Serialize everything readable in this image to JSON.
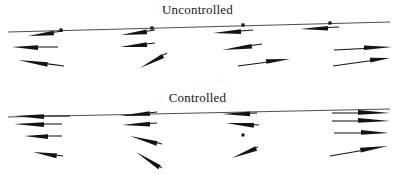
{
  "figure": {
    "caption_top": "Uncontrolled",
    "caption_bottom": "Controlled",
    "ink_color": "#141414",
    "baseline_color": "#3a3a3a",
    "background_color": "#ffffff"
  },
  "panels": [
    {
      "id": "uncontrolled",
      "title": "Uncontrolled"
    },
    {
      "id": "controlled",
      "title": "Controlled"
    }
  ],
  "chart_data": {
    "type": "scatter",
    "subtitle": "",
    "xlabel": "",
    "ylabel": "",
    "grid": false,
    "legend": "none",
    "xlim": [
      0,
      395
    ],
    "ylim": [
      0,
      175
    ],
    "panels": [
      {
        "name": "Uncontrolled",
        "title": "Uncontrolled",
        "baseline": {
          "x1": 8,
          "y1": 32,
          "x2": 390,
          "y2": 22,
          "tilt_deg": -1.5
        },
        "nodes": [
          {
            "x": 61,
            "y": 30
          },
          {
            "x": 152,
            "y": 28
          },
          {
            "x": 243,
            "y": 25
          },
          {
            "x": 330,
            "y": 23
          }
        ],
        "stations": [
          {
            "station": 1,
            "x": 61,
            "vectors": [
              {
                "row": 1,
                "tip_x": 28,
                "tip_y": 36,
                "tail_x": 63,
                "tail_y": 31,
                "length": 35,
                "angle_deg": 188,
                "direction": "left",
                "head_len": 26
              },
              {
                "row": 2,
                "tip_x": 12,
                "tip_y": 47,
                "tail_x": 58,
                "tail_y": 47,
                "length": 46,
                "angle_deg": 180,
                "direction": "left",
                "head_len": 26
              },
              {
                "row": 3,
                "tip_x": 18,
                "tip_y": 60,
                "tail_x": 64,
                "tail_y": 66,
                "length": 46,
                "angle_deg": 187,
                "direction": "left",
                "head_len": 30
              }
            ]
          },
          {
            "station": 2,
            "x": 152,
            "vectors": [
              {
                "row": 1,
                "tip_x": 121,
                "tip_y": 35,
                "tail_x": 155,
                "tail_y": 30,
                "length": 34,
                "angle_deg": 188,
                "direction": "left",
                "head_len": 26
              },
              {
                "row": 2,
                "tip_x": 120,
                "tip_y": 47,
                "tail_x": 155,
                "tail_y": 43,
                "length": 35,
                "angle_deg": 187,
                "direction": "left",
                "head_len": 27
              },
              {
                "row": 3,
                "tip_x": 140,
                "tip_y": 68,
                "tail_x": 167,
                "tail_y": 53,
                "length": 31,
                "angle_deg": 209,
                "direction": "down-left",
                "head_len": 26
              }
            ]
          },
          {
            "station": 3,
            "x": 243,
            "vectors": [
              {
                "row": 1,
                "tip_x": 213,
                "tip_y": 33,
                "tail_x": 253,
                "tail_y": 30,
                "length": 40,
                "angle_deg": 184,
                "direction": "left",
                "head_len": 28
              },
              {
                "row": 2,
                "tip_x": 222,
                "tip_y": 50,
                "tail_x": 262,
                "tail_y": 44,
                "length": 40,
                "angle_deg": 188,
                "direction": "left",
                "head_len": 30
              },
              {
                "row": 3,
                "tip_x": 290,
                "tip_y": 59,
                "tail_x": 238,
                "tail_y": 66,
                "length": 52,
                "angle_deg": 8,
                "direction": "right",
                "head_len": 24
              }
            ]
          },
          {
            "station": 4,
            "x": 330,
            "vectors": [
              {
                "row": 1,
                "tip_x": 300,
                "tip_y": 29,
                "tail_x": 339,
                "tail_y": 27,
                "length": 39,
                "angle_deg": 183,
                "direction": "left",
                "head_len": 28
              },
              {
                "row": 2,
                "tip_x": 392,
                "tip_y": 47,
                "tail_x": 334,
                "tail_y": 50,
                "length": 58,
                "angle_deg": 357,
                "direction": "right",
                "head_len": 28
              },
              {
                "row": 3,
                "tip_x": 390,
                "tip_y": 58,
                "tail_x": 333,
                "tail_y": 66,
                "length": 58,
                "angle_deg": 352,
                "direction": "right",
                "head_len": 20
              }
            ]
          }
        ]
      },
      {
        "name": "Controlled",
        "title": "Controlled",
        "baseline": {
          "x1": 8,
          "y1": 117,
          "x2": 390,
          "y2": 109,
          "tilt_deg": -1.2
        },
        "nodes": [],
        "stray_points": [
          {
            "x": 243,
            "y": 135
          }
        ],
        "stations": [
          {
            "station": 1,
            "x": 61,
            "vectors": [
              {
                "row": 1,
                "tip_x": 14,
                "tip_y": 116,
                "tail_x": 70,
                "tail_y": 116,
                "length": 56,
                "angle_deg": 180,
                "direction": "left",
                "head_len": 30
              },
              {
                "row": 2,
                "tip_x": 14,
                "tip_y": 124,
                "tail_x": 62,
                "tail_y": 124,
                "length": 48,
                "angle_deg": 180,
                "direction": "left",
                "head_len": 30
              },
              {
                "row": 3,
                "tip_x": 24,
                "tip_y": 136,
                "tail_x": 62,
                "tail_y": 136,
                "length": 38,
                "angle_deg": 180,
                "direction": "left",
                "head_len": 24
              },
              {
                "row": 4,
                "tip_x": 33,
                "tip_y": 152,
                "tail_x": 63,
                "tail_y": 156,
                "length": 30,
                "angle_deg": 188,
                "direction": "left",
                "head_len": 24
              }
            ]
          },
          {
            "station": 2,
            "x": 152,
            "vectors": [
              {
                "row": 1,
                "tip_x": 120,
                "tip_y": 116,
                "tail_x": 157,
                "tail_y": 112,
                "length": 37,
                "angle_deg": 186,
                "direction": "left",
                "head_len": 30
              },
              {
                "row": 2,
                "tip_x": 122,
                "tip_y": 125,
                "tail_x": 157,
                "tail_y": 123,
                "length": 35,
                "angle_deg": 183,
                "direction": "left",
                "head_len": 28
              },
              {
                "row": 3,
                "tip_x": 130,
                "tip_y": 136,
                "tail_x": 162,
                "tail_y": 144,
                "length": 33,
                "angle_deg": 194,
                "direction": "down-left",
                "head_len": 28
              },
              {
                "row": 4,
                "tip_x": 136,
                "tip_y": 152,
                "tail_x": 162,
                "tail_y": 168,
                "length": 30,
                "angle_deg": 211,
                "direction": "down-left",
                "head_len": 28
              }
            ]
          },
          {
            "station": 3,
            "x": 243,
            "vectors": [
              {
                "row": 1,
                "tip_x": 222,
                "tip_y": 114,
                "tail_x": 257,
                "tail_y": 113,
                "length": 35,
                "angle_deg": 182,
                "direction": "left",
                "head_len": 28
              },
              {
                "row": 2,
                "tip_x": 226,
                "tip_y": 123,
                "tail_x": 259,
                "tail_y": 125,
                "length": 33,
                "angle_deg": 177,
                "direction": "left",
                "head_len": 28
              },
              {
                "row": 4,
                "tip_x": 232,
                "tip_y": 158,
                "tail_x": 258,
                "tail_y": 147,
                "length": 28,
                "angle_deg": 203,
                "direction": "down-left",
                "head_len": 26
              }
            ]
          },
          {
            "station": 4,
            "x": 330,
            "vectors": [
              {
                "row": 1,
                "tip_x": 390,
                "tip_y": 113,
                "tail_x": 332,
                "tail_y": 113,
                "length": 58,
                "angle_deg": 0,
                "direction": "right",
                "head_len": 32
              },
              {
                "row": 2,
                "tip_x": 390,
                "tip_y": 121,
                "tail_x": 332,
                "tail_y": 121,
                "length": 58,
                "angle_deg": 0,
                "direction": "right",
                "head_len": 32
              },
              {
                "row": 3,
                "tip_x": 389,
                "tip_y": 133,
                "tail_x": 334,
                "tail_y": 133,
                "length": 55,
                "angle_deg": 0,
                "direction": "right",
                "head_len": 28
              },
              {
                "row": 4,
                "tip_x": 388,
                "tip_y": 146,
                "tail_x": 330,
                "tail_y": 156,
                "length": 59,
                "angle_deg": 350,
                "direction": "up-right",
                "head_len": 28
              }
            ]
          }
        ]
      }
    ]
  }
}
